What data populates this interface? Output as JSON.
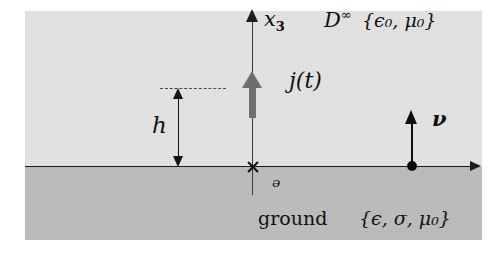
{
  "figure": {
    "type": "half-space-geometry-diagram"
  },
  "regions": {
    "upper": {
      "domain_symbol": "D",
      "domain_superscript": "∞",
      "parameters_open": "{",
      "parameters": "ϵ",
      "parameters_sub_1": "0",
      "parameters_mid": ", μ",
      "parameters_sub_2": "0",
      "parameters_close": "}",
      "parameters_full": "{ϵ₀, μ₀}",
      "fill_color": "#e4e4e4"
    },
    "lower": {
      "label": "ground",
      "parameters_full": "{ϵ, σ, μ₀}",
      "fill_color": "#bdbdbd"
    }
  },
  "axes": {
    "vertical_label": "x",
    "vertical_subscript": "3",
    "horizontal_label": "",
    "origin_label": "ᵊ",
    "origin_marker": "cross-marker"
  },
  "annotations": {
    "source_label": "j(t)",
    "source_color": "#6e6e6e",
    "height_label": "h",
    "normal_vector_label": "ν"
  },
  "colors": {
    "air_fill": "#e4e4e4",
    "ground_fill": "#bdbdbd",
    "ink": "#111111",
    "source_gray": "#6e6e6e",
    "background": "#ffffff"
  }
}
